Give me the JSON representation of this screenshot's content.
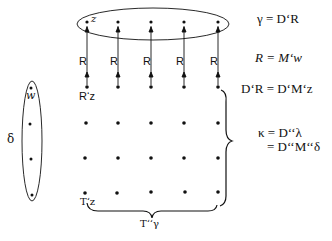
{
  "diagram": {
    "ellipse_top_label": "z",
    "arrow_label": "R",
    "source_label": "R‘z",
    "left_set_point_label": "w",
    "left_set_label": "δ",
    "bottom_left_label": "T‘z",
    "bottom_brace_label": "T‘‘γ",
    "equations": {
      "eq1": "γ = D‘R",
      "eq2": "R = M‘w",
      "eq3": "D‘R = D‘M‘z",
      "eq4a": "κ = D‘‘λ",
      "eq4b": "= D‘‘M‘‘δ"
    },
    "columns_x": [
      87,
      118,
      151,
      184,
      218
    ],
    "rows_y": [
      22,
      87,
      123,
      158,
      193
    ],
    "left_dots": [
      [
        31,
        88
      ],
      [
        30,
        124
      ],
      [
        31,
        159
      ],
      [
        32,
        195
      ]
    ]
  }
}
